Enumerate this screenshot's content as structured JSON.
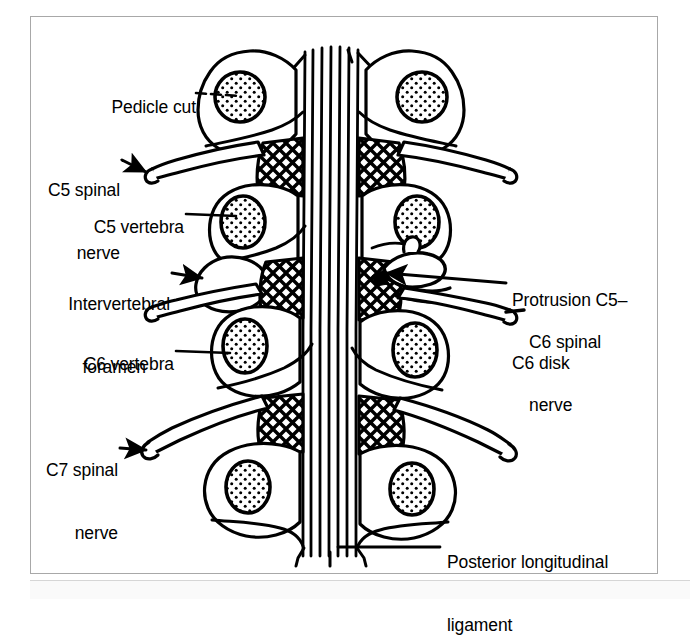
{
  "figure": {
    "type": "anatomical-line-diagram",
    "view": "posterior",
    "background_color": "#ffffff",
    "ink_color": "#000000",
    "frame_color": "#a8a8a8"
  },
  "labels": [
    {
      "id": "pedicle-cut",
      "text": "Pedicle cut",
      "side": "left",
      "align": "right",
      "x": 85,
      "y": 85,
      "leader": "dashed-line",
      "points_to": "pedicle-cut-circle-left-c4"
    },
    {
      "id": "c5-spinal-nerve",
      "text": "C5 spinal\nnerve",
      "line1": "C5 spinal",
      "line2": "nerve",
      "side": "left",
      "align": "right",
      "x": 28,
      "y": 145,
      "leader": "arrow",
      "points_to": "nerve-root-left-c5"
    },
    {
      "id": "c5-vertebra",
      "text": "C5 vertebra",
      "side": "left",
      "align": "right",
      "x": 70,
      "y": 205,
      "leader": "solid-line",
      "points_to": "vertebral-body-left-c5"
    },
    {
      "id": "intervertebral-foramen",
      "text": "Intervertebral\nforamen",
      "line1": "Intervertebral",
      "line2": "foramen",
      "side": "left",
      "align": "right",
      "x": 36,
      "y": 262,
      "leader": "arrow",
      "points_to": "foramen-left-c5-c6"
    },
    {
      "id": "c6-vertebra",
      "text": "C6 vertebra",
      "side": "left",
      "align": "right",
      "x": 61,
      "y": 343,
      "leader": "solid-line",
      "points_to": "vertebral-body-left-c6"
    },
    {
      "id": "c7-spinal-nerve",
      "text": "C7 spinal\nnerve",
      "line1": "C7 spinal",
      "line2": "nerve",
      "side": "left",
      "align": "right",
      "x": 38,
      "y": 425,
      "leader": "arrow",
      "points_to": "nerve-root-left-c7"
    },
    {
      "id": "protrusion-c5-c6-disk",
      "text": "Protrusion C5–\nC6 disk",
      "line1": "Protrusion C5–",
      "line2": "C6 disk",
      "side": "right",
      "align": "left",
      "x": 512,
      "y": 255,
      "leader": "long-arrow",
      "points_to": "disk-protrusion-right"
    },
    {
      "id": "c6-spinal-nerve",
      "text": "C6 spinal\nnerve",
      "line1": "C6 spinal",
      "line2": "nerve",
      "side": "right",
      "align": "left",
      "x": 529,
      "y": 297,
      "leader": "short-line",
      "points_to": "nerve-root-right-c6"
    },
    {
      "id": "posterior-longitudinal-ligament",
      "text": "Posterior longitudinal\nligament",
      "line1": "Posterior longitudinal",
      "line2": "ligament",
      "side": "right",
      "align": "left",
      "x": 447,
      "y": 518,
      "leader": "solid-line",
      "points_to": "ligament-fibers"
    }
  ],
  "structures": {
    "vertebra_levels": [
      "C4",
      "C5",
      "C6",
      "C7"
    ],
    "pedicle_cut_fill": "stippled",
    "intervertebral_disk_fill": "cross-hatch",
    "ligament": "vertical parallel fibers",
    "nerve_roots": [
      "C5 left",
      "C5 right",
      "C6 left",
      "C6 right",
      "C7 left",
      "C7 right"
    ]
  }
}
